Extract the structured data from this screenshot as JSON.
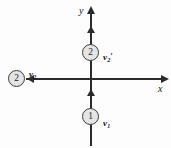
{
  "figure": {
    "background_color": "#fdfdfd",
    "line_color": "#2b2b2b",
    "circle_fill": "#e4e4e4",
    "circle_stroke": "#3a3a3a",
    "text_color": "#141414"
  },
  "axes": {
    "x": {
      "label": "x",
      "direction": "right",
      "arrow": "arrow-right"
    },
    "y": {
      "label": "y",
      "direction": "up",
      "arrow": "arrow-up"
    },
    "origin_label": ""
  },
  "bodies": [
    {
      "id": "circle-2-top",
      "label": "2",
      "position": "above origin on y-axis",
      "velocity_label_base": "v",
      "velocity_label_sub": "2",
      "velocity_label_prime": "′",
      "velocity_direction": "up"
    },
    {
      "id": "circle-1-bottom",
      "label": "1",
      "position": "below origin on y-axis",
      "velocity_label_base": "v",
      "velocity_label_sub": "1",
      "velocity_label_prime": "",
      "velocity_direction": "up"
    },
    {
      "id": "circle-2-left",
      "label": "2",
      "position": "left of origin on x-axis",
      "velocity_label_base": "v",
      "velocity_label_sub": "2",
      "velocity_label_prime": "",
      "velocity_direction": "left"
    }
  ]
}
